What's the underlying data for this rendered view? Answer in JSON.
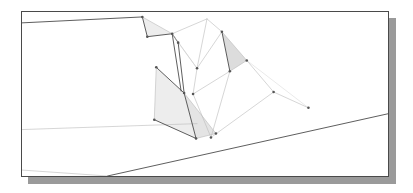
{
  "window": {
    "title": "3D Model Viewport",
    "background_color": "#ffffff"
  },
  "viewport": {
    "name": "wireframe-drawing-viewport",
    "frame": {
      "x": 21,
      "y": 11,
      "width": 368,
      "height": 166
    },
    "border_color": "#4a4a4a",
    "shadow_color": "#9a9a9a",
    "shadow_offset": {
      "x": 7,
      "y": 7
    },
    "paper_color": "#ffffff"
  },
  "drawing": {
    "type": "3d-wireframe-terrain-excavation",
    "view_box": "0 0 368 166",
    "stroke_color_strong": "#4a4a4a",
    "stroke_color_light": "#b9b9b9",
    "stroke_color_faint": "#d4d4d4",
    "shade_fill": "#ededed",
    "shade_fill_dark": "#dcdcdc",
    "vertex_color": "#555555",
    "vertex_radius": 1.3,
    "ground_planes": [
      {
        "name": "upper-ground-plane",
        "points": "0,11 121,5 148,21 156,56 186,78 200,92 230,120 0,120"
      },
      {
        "name": "lower-ground-plane",
        "points": "0,120 230,120 368,104 368,165 86,165"
      }
    ],
    "ground_lines": [
      {
        "name": "top-horizon-line",
        "from": [
          0,
          11
        ],
        "to": [
          121,
          5
        ],
        "weight": "strong"
      },
      {
        "name": "mid-bench-line",
        "from": [
          0,
          119
        ],
        "to": [
          176,
          113
        ],
        "weight": "light"
      },
      {
        "name": "main-slope-line",
        "from": [
          86,
          166
        ],
        "to": [
          368,
          103
        ],
        "weight": "strong"
      },
      {
        "name": "lower-bench-line",
        "from": [
          86,
          166
        ],
        "to": [
          0,
          160
        ],
        "weight": "light"
      }
    ],
    "shaded_faces": [
      {
        "name": "upper-left-shaded-triangle",
        "points": "121,5 126,25 151,22",
        "fill": "#ededed"
      },
      {
        "name": "right-shaded-triangle",
        "points": "201,20 226,49 209,60",
        "fill": "#dcdcdc"
      },
      {
        "name": "large-lower-left-shaded-quad",
        "points": "135,56 163,82 175,128 133,109",
        "fill": "#ededed"
      },
      {
        "name": "lower-left-shaded-wedge",
        "points": "163,82 175,128 195,123",
        "fill": "#e4e4e4"
      }
    ],
    "mesh_edges": [
      {
        "name": "ridge-upper-left",
        "from": [
          121,
          5
        ],
        "to": [
          126,
          25
        ],
        "weight": "strong"
      },
      {
        "name": "ridge-upper-left-base",
        "from": [
          126,
          25
        ],
        "to": [
          151,
          22
        ],
        "weight": "strong"
      },
      {
        "name": "ridge-upper-left-hyp",
        "from": [
          121,
          5
        ],
        "to": [
          151,
          22
        ],
        "weight": "light"
      },
      {
        "name": "crest-notch-left",
        "from": [
          151,
          22
        ],
        "to": [
          157,
          31
        ],
        "weight": "strong"
      },
      {
        "name": "crest-notch-down",
        "from": [
          157,
          31
        ],
        "to": [
          163,
          82
        ],
        "weight": "strong"
      },
      {
        "name": "crest-notch-inner",
        "from": [
          151,
          22
        ],
        "to": [
          160,
          80
        ],
        "weight": "strong"
      },
      {
        "name": "apex-to-crest",
        "from": [
          186,
          7
        ],
        "to": [
          151,
          22
        ],
        "weight": "light"
      },
      {
        "name": "apex-down-ridge",
        "from": [
          186,
          7
        ],
        "to": [
          176,
          57
        ],
        "weight": "light"
      },
      {
        "name": "crest-to-node",
        "from": [
          151,
          22
        ],
        "to": [
          176,
          57
        ],
        "weight": "light"
      },
      {
        "name": "node-to-right",
        "from": [
          176,
          57
        ],
        "to": [
          201,
          20
        ],
        "weight": "light"
      },
      {
        "name": "apex-to-right-peak",
        "from": [
          186,
          7
        ],
        "to": [
          201,
          20
        ],
        "weight": "light"
      },
      {
        "name": "right-peak-down",
        "from": [
          201,
          20
        ],
        "to": [
          209,
          60
        ],
        "weight": "strong"
      },
      {
        "name": "right-peak-out",
        "from": [
          201,
          20
        ],
        "to": [
          226,
          49
        ],
        "weight": "light"
      },
      {
        "name": "right-face-base",
        "from": [
          226,
          49
        ],
        "to": [
          209,
          60
        ],
        "weight": "light"
      },
      {
        "name": "right-node-to-shelf",
        "from": [
          226,
          49
        ],
        "to": [
          253,
          81
        ],
        "weight": "light"
      },
      {
        "name": "node-to-lower",
        "from": [
          176,
          57
        ],
        "to": [
          172,
          83
        ],
        "weight": "light"
      },
      {
        "name": "lower-node-to-right",
        "from": [
          172,
          83
        ],
        "to": [
          209,
          60
        ],
        "weight": "light"
      },
      {
        "name": "lower-node-down",
        "from": [
          172,
          83
        ],
        "to": [
          190,
          127
        ],
        "weight": "light"
      },
      {
        "name": "quad-top-left",
        "from": [
          135,
          56
        ],
        "to": [
          163,
          82
        ],
        "weight": "strong"
      },
      {
        "name": "quad-left-side",
        "from": [
          135,
          56
        ],
        "to": [
          133,
          109
        ],
        "weight": "light"
      },
      {
        "name": "quad-bottom",
        "from": [
          133,
          109
        ],
        "to": [
          175,
          128
        ],
        "weight": "strong"
      },
      {
        "name": "quad-right-side",
        "from": [
          163,
          82
        ],
        "to": [
          175,
          128
        ],
        "weight": "strong"
      },
      {
        "name": "quad-inner-fold",
        "from": [
          163,
          82
        ],
        "to": [
          195,
          123
        ],
        "weight": "light"
      },
      {
        "name": "pit-floor-right",
        "from": [
          175,
          128
        ],
        "to": [
          195,
          123
        ],
        "weight": "light"
      },
      {
        "name": "shelf-edge-left",
        "from": [
          190,
          127
        ],
        "to": [
          253,
          81
        ],
        "weight": "light"
      },
      {
        "name": "shelf-edge-right",
        "from": [
          253,
          81
        ],
        "to": [
          288,
          97
        ],
        "weight": "light"
      },
      {
        "name": "shelf-fall-line",
        "from": [
          209,
          60
        ],
        "to": [
          190,
          127
        ],
        "weight": "light"
      },
      {
        "name": "shelf-to-ground",
        "from": [
          288,
          97
        ],
        "to": [
          226,
          49
        ],
        "weight": "faint"
      },
      {
        "name": "crest-link-to-slope",
        "from": [
          157,
          31
        ],
        "to": [
          176,
          57
        ],
        "weight": "faint"
      }
    ],
    "vertices": [
      {
        "name": "vertex-top-crest",
        "x": 121,
        "y": 5
      },
      {
        "name": "vertex-notch-left",
        "x": 126,
        "y": 25
      },
      {
        "name": "vertex-notch-right",
        "x": 151,
        "y": 22
      },
      {
        "name": "vertex-crest-knee",
        "x": 157,
        "y": 31
      },
      {
        "name": "vertex-center-node",
        "x": 176,
        "y": 57
      },
      {
        "name": "vertex-right-peak",
        "x": 201,
        "y": 20
      },
      {
        "name": "vertex-right-out",
        "x": 226,
        "y": 49
      },
      {
        "name": "vertex-right-base",
        "x": 209,
        "y": 60
      },
      {
        "name": "vertex-lower-node",
        "x": 172,
        "y": 83
      },
      {
        "name": "vertex-quad-top-left",
        "x": 135,
        "y": 56
      },
      {
        "name": "vertex-quad-bottom-left",
        "x": 133,
        "y": 109
      },
      {
        "name": "vertex-quad-fold",
        "x": 163,
        "y": 82
      },
      {
        "name": "vertex-quad-bottom",
        "x": 175,
        "y": 128
      },
      {
        "name": "vertex-pit-floor",
        "x": 195,
        "y": 123
      },
      {
        "name": "vertex-shelf-left",
        "x": 190,
        "y": 127
      },
      {
        "name": "vertex-shelf-mid",
        "x": 253,
        "y": 81
      },
      {
        "name": "vertex-shelf-right",
        "x": 288,
        "y": 97
      }
    ]
  }
}
